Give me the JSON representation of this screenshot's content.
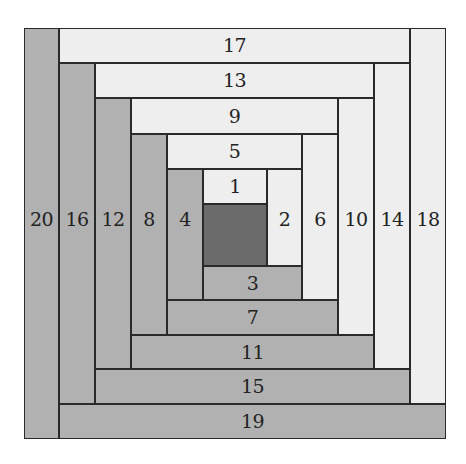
{
  "colors": {
    "light": "#eeeeee",
    "dark": "#b1b1b1",
    "center": "#6b6b6b",
    "line": "#2a2a2a",
    "text": "#222222"
  },
  "center": {
    "label": "",
    "tone": "center",
    "x": 203,
    "y": 204,
    "w": 64,
    "h": 62
  },
  "pieces": [
    {
      "label": "1",
      "tone": "light",
      "orient": "h",
      "x": 203,
      "y": 169,
      "w": 64,
      "h": 35
    },
    {
      "label": "2",
      "tone": "light",
      "orient": "v",
      "x": 267,
      "y": 169,
      "w": 35,
      "h": 97
    },
    {
      "label": "3",
      "tone": "dark",
      "orient": "h",
      "x": 203,
      "y": 266,
      "w": 99,
      "h": 34
    },
    {
      "label": "4",
      "tone": "dark",
      "orient": "v",
      "x": 167,
      "y": 169,
      "w": 36,
      "h": 131
    },
    {
      "label": "5",
      "tone": "light",
      "orient": "h",
      "x": 167,
      "y": 134,
      "w": 135,
      "h": 35
    },
    {
      "label": "6",
      "tone": "light",
      "orient": "v",
      "x": 302,
      "y": 134,
      "w": 36,
      "h": 166
    },
    {
      "label": "7",
      "tone": "dark",
      "orient": "h",
      "x": 167,
      "y": 300,
      "w": 171,
      "h": 35
    },
    {
      "label": "8",
      "tone": "dark",
      "orient": "v",
      "x": 131,
      "y": 134,
      "w": 36,
      "h": 201
    },
    {
      "label": "9",
      "tone": "light",
      "orient": "h",
      "x": 131,
      "y": 98,
      "w": 207,
      "h": 36
    },
    {
      "label": "10",
      "tone": "light",
      "orient": "v",
      "x": 338,
      "y": 98,
      "w": 36,
      "h": 237
    },
    {
      "label": "11",
      "tone": "dark",
      "orient": "h",
      "x": 131,
      "y": 335,
      "w": 243,
      "h": 34
    },
    {
      "label": "12",
      "tone": "dark",
      "orient": "v",
      "x": 95,
      "y": 98,
      "w": 36,
      "h": 271
    },
    {
      "label": "13",
      "tone": "light",
      "orient": "h",
      "x": 95,
      "y": 63,
      "w": 279,
      "h": 35
    },
    {
      "label": "14",
      "tone": "light",
      "orient": "v",
      "x": 374,
      "y": 63,
      "w": 36,
      "h": 306
    },
    {
      "label": "15",
      "tone": "dark",
      "orient": "h",
      "x": 95,
      "y": 369,
      "w": 315,
      "h": 35
    },
    {
      "label": "16",
      "tone": "dark",
      "orient": "v",
      "x": 59,
      "y": 63,
      "w": 36,
      "h": 341
    },
    {
      "label": "17",
      "tone": "light",
      "orient": "h",
      "x": 59,
      "y": 28,
      "w": 351,
      "h": 35
    },
    {
      "label": "18",
      "tone": "light",
      "orient": "v",
      "x": 410,
      "y": 28,
      "w": 36,
      "h": 376
    },
    {
      "label": "19",
      "tone": "dark",
      "orient": "h",
      "x": 59,
      "y": 404,
      "w": 387,
      "h": 35
    },
    {
      "label": "20",
      "tone": "dark",
      "orient": "v",
      "x": 24,
      "y": 28,
      "w": 35,
      "h": 411
    }
  ],
  "vertical_label_y": 218
}
